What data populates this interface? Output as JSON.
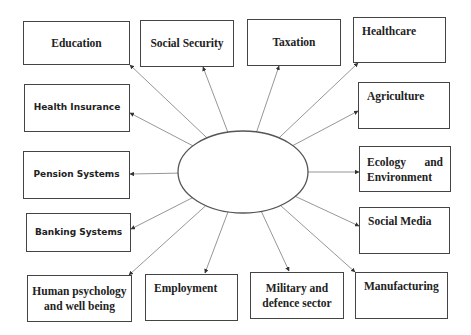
{
  "diagram": {
    "center_node": {
      "label": "",
      "shape": "ellipse",
      "cx": 243,
      "cy": 172,
      "rx": 65,
      "ry": 41
    },
    "nodes": [
      {
        "id": "education",
        "label": "Education",
        "x": 23,
        "y": 21,
        "w": 107,
        "h": 44,
        "font": "serif",
        "align": "center",
        "ax": 130,
        "ay": 65
      },
      {
        "id": "social-security",
        "label": "Social Security",
        "x": 140,
        "y": 20,
        "w": 94,
        "h": 47,
        "font": "serif",
        "align": "center",
        "ax": 203,
        "ay": 67
      },
      {
        "id": "taxation",
        "label": "Taxation",
        "x": 247,
        "y": 19,
        "w": 94,
        "h": 47,
        "font": "serif",
        "align": "center",
        "ax": 279,
        "ay": 66
      },
      {
        "id": "healthcare",
        "label": "Healthcare",
        "x": 353,
        "y": 17,
        "w": 93,
        "h": 46,
        "font": "serif",
        "align": "topleft",
        "ax": 358,
        "ay": 63
      },
      {
        "id": "health-insurance",
        "label": "Health Insurance",
        "x": 24,
        "y": 84,
        "w": 106,
        "h": 48,
        "font": "sans",
        "align": "center",
        "ax": 130,
        "ay": 113
      },
      {
        "id": "agriculture",
        "label": "Agriculture",
        "x": 358,
        "y": 82,
        "w": 92,
        "h": 47,
        "font": "serif",
        "align": "topleft",
        "ax": 358,
        "ay": 111
      },
      {
        "id": "pension-systems",
        "label": "Pension Systems",
        "x": 23,
        "y": 151,
        "w": 107,
        "h": 48,
        "font": "sans",
        "align": "center",
        "ax": 130,
        "ay": 174
      },
      {
        "id": "ecology-environment",
        "label": "Ecology and Environment",
        "x": 359,
        "y": 146,
        "w": 92,
        "h": 46,
        "font": "serif",
        "align": "justify",
        "ax": 359,
        "ay": 172
      },
      {
        "id": "banking-systems",
        "label": "Banking Systems",
        "x": 26,
        "y": 213,
        "w": 105,
        "h": 39,
        "font": "sans",
        "align": "center",
        "ax": 131,
        "ay": 229
      },
      {
        "id": "social-media",
        "label": "Social Media",
        "x": 359,
        "y": 207,
        "w": 91,
        "h": 47,
        "font": "serif",
        "align": "topleft",
        "ax": 359,
        "ay": 226
      },
      {
        "id": "human-psychology",
        "label": "Human psychology and well being",
        "x": 27,
        "y": 275,
        "w": 105,
        "h": 47,
        "font": "serif",
        "align": "center",
        "ax": 129,
        "ay": 275
      },
      {
        "id": "employment",
        "label": "Employment",
        "x": 145,
        "y": 274,
        "w": 93,
        "h": 47,
        "font": "serif",
        "align": "topleft",
        "ax": 205,
        "ay": 273
      },
      {
        "id": "military-defence",
        "label": "Military and defence sector",
        "x": 250,
        "y": 272,
        "w": 94,
        "h": 47,
        "font": "serif",
        "align": "center",
        "ax": 289,
        "ay": 271
      },
      {
        "id": "manufacturing",
        "label": "Manufacturing",
        "x": 355,
        "y": 272,
        "w": 93,
        "h": 47,
        "font": "serif",
        "align": "topleft",
        "ax": 355,
        "ay": 272
      }
    ],
    "colors": {
      "line": "#8a8a8a",
      "border": "#444444",
      "text": "#222222",
      "arrow": "#333333"
    }
  }
}
